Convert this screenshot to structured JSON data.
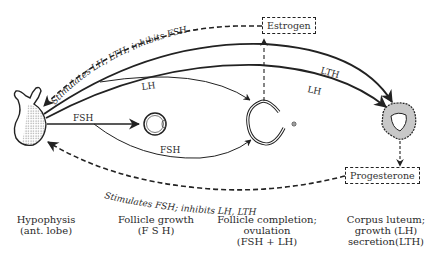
{
  "diagram": {
    "type": "hormonal-feedback-flow",
    "nodes": {
      "hypophysis": {
        "label_line1": "Hypophysis",
        "label_line2": "(ant. lobe)"
      },
      "follicle_growth": {
        "label_line1": "Follicle growth",
        "label_line2": "(F S H)"
      },
      "follicle_completion": {
        "label_line1": "Follicle completion;",
        "label_line2": "ovulation",
        "label_line3": "(FSH + LH)"
      },
      "corpus_luteum": {
        "label_line1": "Corpus luteum;",
        "label_line2": "growth (LH)",
        "label_line3": "secretion(LTH)"
      }
    },
    "boxes": {
      "estrogen": "Estrogen",
      "progesterone": "Progesterone"
    },
    "arrows": {
      "fsh_to_follicle": "FSH",
      "fsh_to_completion": "FSH",
      "lh_to_completion": "LH",
      "lth_to_corpus": "LTH",
      "lh_to_corpus": "LH",
      "estrogen_feedback": "Stimulates LH, LTH; inhibits FSH",
      "progesterone_feedback": "Stimulates FSH; inhibits LH, LTH"
    },
    "colors": {
      "ink": "#222222",
      "background": "#ffffff",
      "stipple": "#9a9a9a"
    }
  }
}
